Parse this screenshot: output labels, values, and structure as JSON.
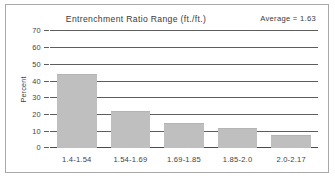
{
  "figure": {
    "background_color": "#ffffff",
    "frame_color": "#a8a8a8"
  },
  "chart_data": {
    "type": "bar",
    "title": "Entrenchment Ratio Range (ft./ft.)",
    "annotation": "Average = 1.63",
    "xlabel": "",
    "ylabel": "Percent",
    "categories": [
      "1.4-1.54",
      "1.54-1.69",
      "1.69-1.85",
      "1.85-2.0",
      "2.0-2.17"
    ],
    "values": [
      44,
      22,
      15,
      12,
      7.5
    ],
    "ylim": [
      0,
      70
    ],
    "yticks": [
      0,
      10,
      20,
      30,
      40,
      50,
      60,
      70
    ],
    "ytick_labels": [
      "0",
      "10",
      "20",
      "30",
      "40",
      "50",
      "60",
      "70"
    ],
    "grid": true,
    "legend": false,
    "bar_color": "#bfbfbf",
    "gridline_color": "#5d5d5d"
  }
}
